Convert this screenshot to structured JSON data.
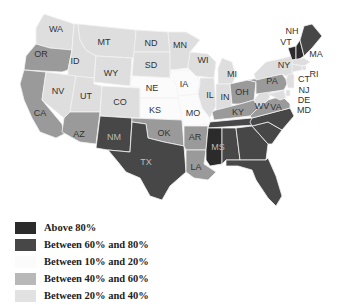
{
  "map": {
    "title": "",
    "categories": {
      "above80": {
        "label": "Above 80%",
        "color": "#2b2b2b"
      },
      "b60_80": {
        "label": "Between 60% and 80%",
        "color": "#474747"
      },
      "b10_20": {
        "label": "Between 10% and 20%",
        "color": "#fbfbfb"
      },
      "b40_60": {
        "label": "Between 40% and 60%",
        "color": "#9a9a9a"
      },
      "b20_40": {
        "label": "Between 20% and 40%",
        "color": "#dedede"
      }
    },
    "states": [
      {
        "abbr": "WA",
        "cat": "b20_40"
      },
      {
        "abbr": "OR",
        "cat": "b40_60"
      },
      {
        "abbr": "CA",
        "cat": "b40_60"
      },
      {
        "abbr": "ID",
        "cat": "b20_40"
      },
      {
        "abbr": "NV",
        "cat": "b20_40"
      },
      {
        "abbr": "MT",
        "cat": "b20_40"
      },
      {
        "abbr": "WY",
        "cat": "b20_40"
      },
      {
        "abbr": "UT",
        "cat": "b20_40"
      },
      {
        "abbr": "AZ",
        "cat": "b40_60"
      },
      {
        "abbr": "CO",
        "cat": "b20_40"
      },
      {
        "abbr": "NM",
        "cat": "b60_80"
      },
      {
        "abbr": "ND",
        "cat": "b20_40"
      },
      {
        "abbr": "SD",
        "cat": "b20_40"
      },
      {
        "abbr": "NE",
        "cat": "b10_20"
      },
      {
        "abbr": "KS",
        "cat": "b10_20"
      },
      {
        "abbr": "OK",
        "cat": "b40_60"
      },
      {
        "abbr": "TX",
        "cat": "b60_80"
      },
      {
        "abbr": "MN",
        "cat": "b20_40"
      },
      {
        "abbr": "IA",
        "cat": "b10_20"
      },
      {
        "abbr": "MO",
        "cat": "b10_20"
      },
      {
        "abbr": "AR",
        "cat": "b40_60"
      },
      {
        "abbr": "LA",
        "cat": "b40_60"
      },
      {
        "abbr": "WI",
        "cat": "b20_40"
      },
      {
        "abbr": "IL",
        "cat": "b20_40"
      },
      {
        "abbr": "MI",
        "cat": "b20_40"
      },
      {
        "abbr": "IN",
        "cat": "b20_40"
      },
      {
        "abbr": "OH",
        "cat": "b40_60"
      },
      {
        "abbr": "KY",
        "cat": "b40_60"
      },
      {
        "abbr": "TN",
        "cat": "b60_80"
      },
      {
        "abbr": "MS",
        "cat": "above80"
      },
      {
        "abbr": "AL",
        "cat": "b60_80"
      },
      {
        "abbr": "GA",
        "cat": "b60_80"
      },
      {
        "abbr": "FL",
        "cat": "b60_80"
      },
      {
        "abbr": "SC",
        "cat": "b60_80"
      },
      {
        "abbr": "NC",
        "cat": "b60_80"
      },
      {
        "abbr": "VA",
        "cat": "b40_60"
      },
      {
        "abbr": "WV",
        "cat": "b20_40"
      },
      {
        "abbr": "PA",
        "cat": "b40_60"
      },
      {
        "abbr": "NY",
        "cat": "b20_40"
      },
      {
        "abbr": "VT",
        "cat": "above80"
      },
      {
        "abbr": "NH",
        "cat": "above80"
      },
      {
        "abbr": "ME",
        "cat": "b60_80"
      },
      {
        "abbr": "MA",
        "cat": "b20_40"
      },
      {
        "abbr": "RI",
        "cat": "b20_40"
      },
      {
        "abbr": "CT",
        "cat": "b20_40"
      },
      {
        "abbr": "NJ",
        "cat": "b20_40"
      },
      {
        "abbr": "DE",
        "cat": "b20_40"
      },
      {
        "abbr": "MD",
        "cat": "b20_40"
      }
    ]
  },
  "legend": [
    {
      "label": "Above 80%",
      "color": "#2b2b2b"
    },
    {
      "label": "Between 60% and 80%",
      "color": "#474747"
    },
    {
      "label": "Between 10% and 20%",
      "color": "#fbfbfb"
    },
    {
      "label": "Between 40% and 60%",
      "color": "#b8b8b8"
    },
    {
      "label": "Between 20% and 40%",
      "color": "#e2e2e2"
    }
  ]
}
